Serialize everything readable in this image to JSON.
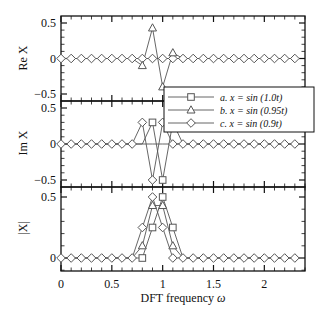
{
  "chart_data": {
    "type": "line",
    "xlabel": "DFT frequency ω",
    "x_ticks": [
      "0",
      "0.5",
      "1",
      "1.5",
      "2"
    ],
    "x_tick_values": [
      0,
      0.5,
      1,
      1.5,
      2
    ],
    "xlim": [
      0,
      2.4
    ],
    "x": [
      0,
      0.1,
      0.2,
      0.3,
      0.4,
      0.5,
      0.6,
      0.7,
      0.8,
      0.9,
      1.0,
      1.1,
      1.2,
      1.3,
      1.4,
      1.5,
      1.6,
      1.7,
      1.8,
      1.9,
      2.0,
      2.1,
      2.2,
      2.3
    ],
    "legend": {
      "position": "inside upper right of middle panel",
      "entries": [
        {
          "label": "a. x = sin (1.0t)",
          "marker": "square"
        },
        {
          "label": "b. x = sin (0.95t)",
          "marker": "triangle"
        },
        {
          "label": "c. x = sin (0.9t)",
          "marker": "diamond"
        }
      ]
    },
    "panels": [
      {
        "ylabel": "Re X",
        "ylim": [
          -0.6,
          0.6
        ],
        "y_ticks": [
          "0.5",
          "0",
          "−0.5"
        ],
        "y_tick_values": [
          0.5,
          0,
          -0.5
        ],
        "series": [
          {
            "name": "a. x = sin (1.0t)",
            "marker": "square",
            "values": [
              0,
              0,
              0,
              0,
              0,
              0,
              0,
              0,
              0,
              0,
              0,
              0,
              0,
              0,
              0,
              0,
              0,
              0,
              0,
              0,
              0,
              0,
              0,
              0
            ]
          },
          {
            "name": "b. x = sin (0.95t)",
            "marker": "triangle",
            "values": [
              0,
              0,
              0,
              0,
              0,
              0,
              0,
              0,
              -0.1,
              0.43,
              -0.4,
              0.08,
              0,
              0,
              0,
              0,
              0,
              0,
              0,
              0,
              0,
              0,
              0,
              0
            ]
          },
          {
            "name": "c. x = sin (0.9t)",
            "marker": "diamond",
            "values": [
              0,
              0,
              0,
              0,
              0,
              0,
              0,
              0,
              0,
              0,
              0,
              0,
              0,
              0,
              0,
              0,
              0,
              0,
              0,
              0,
              0,
              0,
              0,
              0
            ]
          }
        ]
      },
      {
        "ylabel": "Im X",
        "ylim": [
          -0.6,
          0.6
        ],
        "y_ticks": [
          "0.5",
          "0",
          "−0.5"
        ],
        "y_tick_values": [
          0.5,
          0,
          -0.5
        ],
        "series": [
          {
            "name": "a. x = sin (1.0t)",
            "marker": "square",
            "values": [
              0,
              0,
              0,
              0,
              0,
              0,
              0,
              0,
              0,
              0.3,
              -0.5,
              0.3,
              0,
              0,
              0,
              0,
              0,
              0,
              0,
              0,
              0,
              0,
              0,
              0
            ]
          },
          {
            "name": "b. x = sin (0.95t)",
            "marker": "triangle",
            "values": [
              0,
              0,
              0,
              0,
              0,
              0,
              0,
              0,
              0,
              0,
              0,
              0,
              0,
              0,
              0,
              0,
              0,
              0,
              0,
              0,
              0,
              0,
              0,
              0
            ]
          },
          {
            "name": "c. x = sin (0.9t)",
            "marker": "diamond",
            "values": [
              0,
              0,
              0,
              0,
              0,
              0,
              0,
              0,
              0.3,
              -0.5,
              0.3,
              0,
              0,
              0,
              0,
              0,
              0,
              0,
              0,
              0,
              0,
              0,
              0,
              0
            ]
          }
        ]
      },
      {
        "ylabel": "|X|",
        "ylim": [
          -0.05,
          0.6
        ],
        "y_ticks": [
          "0.5",
          "0"
        ],
        "y_tick_values": [
          0.5,
          0
        ],
        "series": [
          {
            "name": "a. x = sin (1.0t)",
            "marker": "square",
            "values": [
              0,
              0,
              0,
              0,
              0,
              0,
              0,
              0,
              0,
              0.25,
              0.5,
              0.25,
              0,
              0,
              0,
              0,
              0,
              0,
              0,
              0,
              0,
              0,
              0,
              0
            ]
          },
          {
            "name": "b. x = sin (0.95t)",
            "marker": "triangle",
            "values": [
              0,
              0,
              0,
              0,
              0,
              0,
              0,
              0,
              0.1,
              0.43,
              0.43,
              0.1,
              0,
              0,
              0,
              0,
              0,
              0,
              0,
              0,
              0,
              0,
              0,
              0
            ]
          },
          {
            "name": "c. x = sin (0.9t)",
            "marker": "diamond",
            "values": [
              0,
              0,
              0,
              0,
              0,
              0,
              0,
              0,
              0.25,
              0.5,
              0.25,
              0,
              0,
              0,
              0,
              0,
              0,
              0,
              0,
              0,
              0,
              0,
              0,
              0
            ]
          }
        ]
      }
    ]
  },
  "labels": {
    "xlabel_text": "DFT frequency ",
    "xlabel_symbol": "ω",
    "panel1_ylabel": "Re X",
    "panel2_ylabel": "Im X",
    "panel3_ylabel": "|X|"
  },
  "colors": {
    "line": "#555555",
    "frame": "#111111",
    "marker_fill": "#ffffff"
  }
}
